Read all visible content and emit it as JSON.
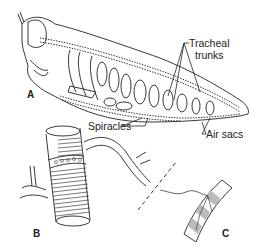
{
  "figure": {
    "panels": [
      {
        "id": "A",
        "label": "A",
        "description": "Longitudinal view of grasshopper showing tracheal system"
      },
      {
        "id": "B",
        "label": "B",
        "description": "Enlarged tracheal tube with spiral thickenings and branches"
      },
      {
        "id": "C",
        "label": "C",
        "description": "Tracheole ending on muscle fiber"
      }
    ],
    "annotations": {
      "tracheal_trunks_line1": "Tracheal",
      "tracheal_trunks_line2": "trunks",
      "spiracles": "Spiracles",
      "air_sacs": "Air sacs"
    },
    "colors": {
      "ink": "#222222",
      "background": "#ffffff",
      "shade": "#bbbbbb"
    }
  }
}
